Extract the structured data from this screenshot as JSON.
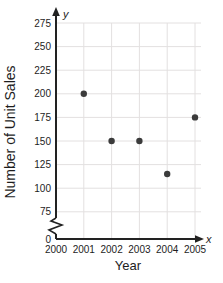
{
  "chart_data": {
    "type": "scatter",
    "title": "",
    "xlabel": "Year",
    "ylabel": "Number of Unit Sales",
    "x_arrow_label": "x",
    "y_arrow_label": "y",
    "x": [
      2001,
      2002,
      2003,
      2004,
      2005
    ],
    "values": [
      200,
      150,
      150,
      115,
      175
    ],
    "x_ticks": [
      2000,
      2001,
      2002,
      2003,
      2004,
      2005
    ],
    "y_ticks": [
      0,
      75,
      100,
      125,
      150,
      175,
      200,
      225,
      250,
      275
    ],
    "y_axis_break_between": [
      0,
      75
    ],
    "xlim": [
      2000,
      2005.5
    ],
    "ylim_shown": [
      75,
      275
    ],
    "grid": true,
    "legend": false,
    "colors": {
      "point": "#3b3b3b",
      "grid": "#e3e0e0",
      "axis": "#222222",
      "text": "#1d1d1d",
      "background": "#ffffff"
    }
  }
}
